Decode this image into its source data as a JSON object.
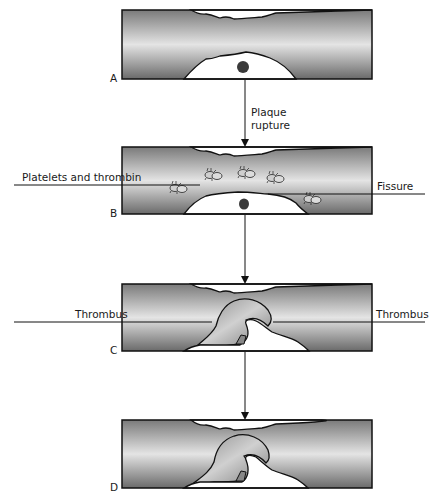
{
  "diagram": {
    "panels": [
      {
        "id": "A",
        "label": "A"
      },
      {
        "id": "B",
        "label": "B"
      },
      {
        "id": "C",
        "label": "C"
      },
      {
        "id": "D",
        "label": "D"
      }
    ],
    "arrows": [
      {
        "from": "A",
        "to": "B",
        "label_line1": "Plaque",
        "label_line2": "rupture"
      },
      {
        "from": "B",
        "to": "C"
      },
      {
        "from": "C",
        "to": "D"
      }
    ],
    "callouts": {
      "platelets": "Platelets and thrombin",
      "fissure": "Fissure",
      "thrombus_left": "Thrombus",
      "thrombus_right": "Thrombus"
    },
    "colors": {
      "vessel_dark": "#6e6e6e",
      "vessel_light": "#e2e2e2",
      "outline": "#111111",
      "plaque": "#ffffff",
      "core": "#3a3a3a"
    }
  }
}
